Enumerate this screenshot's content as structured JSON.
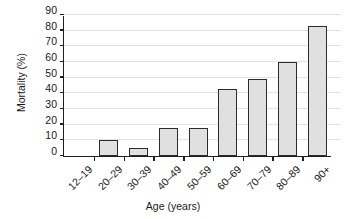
{
  "chart_data": {
    "type": "bar",
    "title": "",
    "xlabel": "Age (years)",
    "ylabel": "Mortality (%)",
    "categories": [
      "12–19",
      "20–29",
      "30–39",
      "40–49",
      "50–59",
      "60–69",
      "70–79",
      "80–89",
      "90+"
    ],
    "values": [
      0,
      10,
      5,
      18,
      18,
      43,
      49,
      60,
      83
    ],
    "ylim": [
      0,
      90
    ],
    "yticks": [
      0,
      10,
      20,
      30,
      40,
      50,
      60,
      70,
      80,
      90
    ],
    "ytick_labels": [
      "0",
      "10",
      "20",
      "30",
      "40",
      "50",
      "60",
      "70",
      "80",
      "90"
    ],
    "grid": true,
    "legend": "none",
    "series": [
      {
        "name": "Mortality",
        "values": [
          0,
          10,
          5,
          18,
          18,
          43,
          49,
          60,
          83
        ]
      }
    ],
    "colors": {
      "bar_fill": "#e0e0e0",
      "bar_edge": "#2b2b2b",
      "axis": "#1f1f1f",
      "gridline": "#e2e2e2",
      "text": "#1a1a1a",
      "background": "#ffffff"
    }
  }
}
